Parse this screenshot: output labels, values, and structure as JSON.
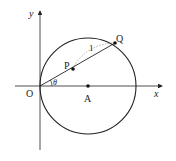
{
  "labels": {
    "y_axis": "y",
    "x_axis": "x",
    "origin": "O",
    "center": "A",
    "point_p": "P",
    "point_q": "Q",
    "angle": "θ",
    "arc_length": "1"
  },
  "colors": {
    "line": "#222222",
    "dashed": "#999999"
  }
}
